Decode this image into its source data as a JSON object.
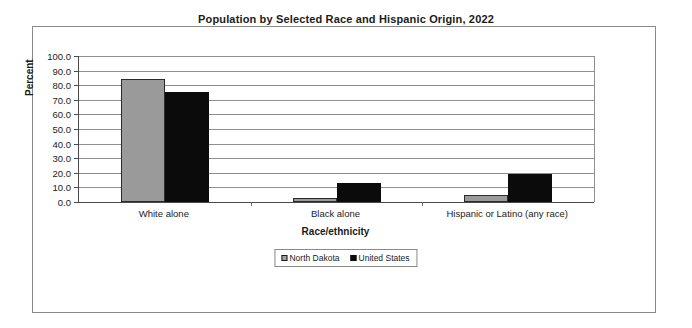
{
  "chart_data": {
    "type": "bar",
    "title": "Population by Selected Race and Hispanic Origin, 2022",
    "xlabel": "Race/ethnicity",
    "ylabel": "Percent",
    "categories": [
      "White alone",
      "Black alone",
      "Hispanic or Latino (any race)"
    ],
    "series": [
      {
        "name": "North Dakota",
        "values": [
          84.0,
          3.0,
          4.5
        ],
        "color": "#9a9a9a"
      },
      {
        "name": "United States",
        "values": [
          75.5,
          13.0,
          19.0
        ],
        "color": "#0b0b0b"
      }
    ],
    "ylim": [
      0.0,
      100.0
    ],
    "ytick_labels": [
      "100.0",
      "90.0",
      "80.0",
      "70.0",
      "60.0",
      "50.0",
      "40.0",
      "30.0",
      "20.0",
      "10.0",
      "0.0"
    ],
    "ytick_values": [
      100.0,
      90.0,
      80.0,
      70.0,
      60.0,
      50.0,
      40.0,
      30.0,
      20.0,
      10.0,
      0.0
    ],
    "grid": true,
    "legend_position": "bottom-center",
    "legend_entries": [
      "North Dakota",
      "United States"
    ]
  }
}
